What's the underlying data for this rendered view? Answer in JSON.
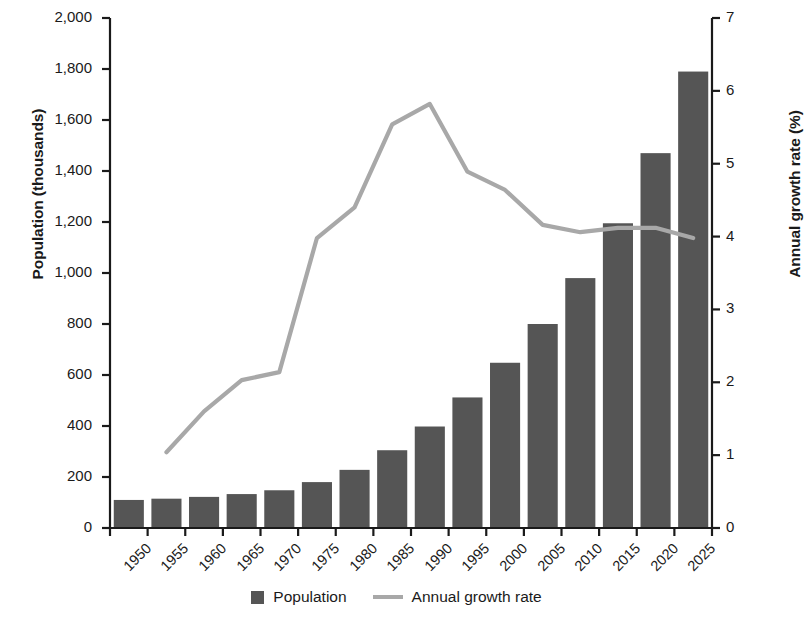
{
  "chart_data": {
    "type": "bar",
    "title": "",
    "xlabel": "",
    "categories": [
      "1950",
      "1955",
      "1960",
      "1965",
      "1970",
      "1975",
      "1980",
      "1985",
      "1990",
      "1995",
      "2000",
      "2005",
      "2010",
      "2015",
      "2020",
      "2025"
    ],
    "grid": false,
    "legend_position": "bottom",
    "axes": {
      "left": {
        "label": "Population (thousands)",
        "min": 0,
        "max": 2000,
        "step": 200,
        "ticks": [
          "0",
          "200",
          "400",
          "600",
          "800",
          "1,000",
          "1,200",
          "1,400",
          "1,600",
          "1,800",
          "2,000"
        ]
      },
      "right": {
        "label": "Annual growth rate (%)",
        "min": 0,
        "max": 7,
        "step": 1,
        "ticks": [
          "0",
          "1",
          "2",
          "3",
          "4",
          "5",
          "6",
          "7"
        ]
      }
    },
    "series": [
      {
        "name": "Population",
        "type": "bar",
        "axis": "left",
        "color": "#555555",
        "values": [
          110,
          115,
          122,
          133,
          148,
          180,
          228,
          305,
          398,
          512,
          648,
          800,
          980,
          1195,
          1470,
          1790
        ]
      },
      {
        "name": "Annual growth rate",
        "type": "line",
        "axis": "right",
        "color": "#a8a8a8",
        "values": [
          null,
          1.04,
          1.6,
          2.03,
          2.14,
          3.98,
          4.4,
          5.54,
          5.82,
          4.89,
          4.64,
          4.16,
          4.06,
          4.12,
          4.12,
          3.98
        ]
      }
    ]
  },
  "legend": {
    "items": [
      {
        "label": "Population",
        "marker": "square",
        "color": "#555555"
      },
      {
        "label": "Annual growth rate",
        "marker": "line",
        "color": "#a8a8a8"
      }
    ]
  }
}
